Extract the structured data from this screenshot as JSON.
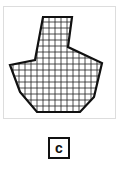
{
  "figure": {
    "label": "c",
    "shape": "irregular polygon with grid fill",
    "colors": {
      "outline": "#111111",
      "grid": "#222222",
      "frame": "#dddddd"
    }
  }
}
